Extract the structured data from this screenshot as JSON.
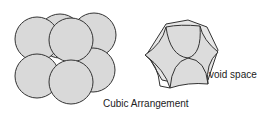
{
  "diagram": {
    "caption": "Cubic Arrangement",
    "void_label": "void space",
    "colors": {
      "sphere_fill": "#d9d9d9",
      "stroke": "#333333",
      "text": "#222222"
    }
  }
}
